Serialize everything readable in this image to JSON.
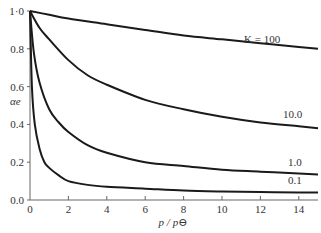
{
  "chart_data": {
    "type": "line",
    "title": "",
    "xlabel": "p / p⊖",
    "ylabel": "αe",
    "xlim": [
      0,
      15
    ],
    "ylim": [
      0,
      1.0
    ],
    "x_ticks": [
      0,
      2,
      4,
      6,
      8,
      10,
      12,
      14
    ],
    "y_ticks": [
      "0.0",
      "0.2",
      "0.4",
      "0.6",
      "0.8",
      "1·0"
    ],
    "grid": false,
    "legend": "inline labels at right end of curves",
    "series": [
      {
        "name": "K = 100",
        "label": "K = 100",
        "x": [
          0,
          1,
          2,
          4,
          6,
          8,
          10,
          12,
          14,
          15
        ],
        "y": [
          1.0,
          0.98,
          0.96,
          0.93,
          0.9,
          0.87,
          0.85,
          0.83,
          0.81,
          0.8
        ]
      },
      {
        "name": "10.0",
        "label": "10.0",
        "x": [
          0,
          0.5,
          1,
          2,
          3,
          4,
          6,
          8,
          10,
          12,
          14,
          15
        ],
        "y": [
          1.0,
          0.91,
          0.85,
          0.74,
          0.66,
          0.61,
          0.53,
          0.48,
          0.44,
          0.41,
          0.39,
          0.38
        ]
      },
      {
        "name": "1.0",
        "label": "1.0",
        "x": [
          0,
          0.2,
          0.5,
          1,
          1.5,
          2,
          3,
          4,
          6,
          8,
          10,
          12,
          14,
          15
        ],
        "y": [
          1.0,
          0.78,
          0.62,
          0.48,
          0.41,
          0.36,
          0.29,
          0.25,
          0.2,
          0.18,
          0.16,
          0.15,
          0.14,
          0.135
        ]
      },
      {
        "name": "0.1",
        "label": "0.1",
        "x": [
          0,
          0.1,
          0.25,
          0.5,
          0.75,
          1,
          1.5,
          2,
          3,
          4,
          6,
          8,
          10,
          12,
          14,
          15
        ],
        "y": [
          1.0,
          0.6,
          0.4,
          0.27,
          0.2,
          0.17,
          0.13,
          0.1,
          0.08,
          0.07,
          0.06,
          0.05,
          0.045,
          0.042,
          0.04,
          0.04
        ]
      }
    ]
  }
}
